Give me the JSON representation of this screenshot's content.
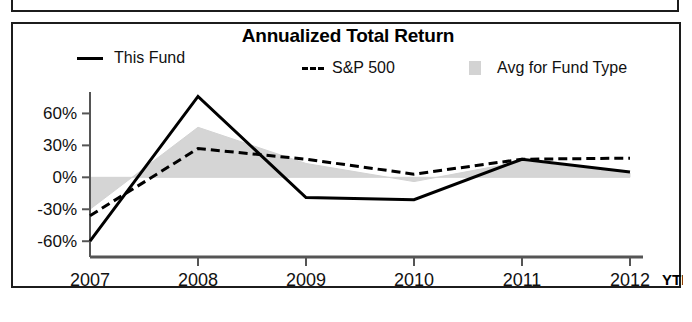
{
  "panel": {
    "title": "Annualized Total Return"
  },
  "legend": {
    "items": [
      {
        "key": "this_fund",
        "label": "This Fund",
        "marker": "solid-line"
      },
      {
        "key": "sp500",
        "label": "S&P 500",
        "marker": "dashed-line"
      },
      {
        "key": "avg_fund_type",
        "label": "Avg for Fund Type",
        "marker": "gray-area-swatch"
      }
    ]
  },
  "axis": {
    "y_ticks": [
      "60%",
      "30%",
      "0%",
      "-30%",
      "-60%"
    ],
    "x_ticks": [
      "2007",
      "2008",
      "2009",
      "2010",
      "2011",
      "2012"
    ],
    "x_suffix": "YTD"
  },
  "colors": {
    "line": "#000000",
    "area": "#d3d3d3",
    "axis": "#555555",
    "border": "#1c1c1c",
    "text": "#111111"
  },
  "chart_data": {
    "type": "line",
    "title": "Annualized Total Return",
    "xlabel": "",
    "ylabel": "",
    "x": [
      "2007",
      "2008",
      "2009",
      "2010",
      "2011",
      "2012"
    ],
    "x_note": "2012 value is YTD",
    "ylim": [
      -72,
      82
    ],
    "yticks": [
      -60,
      -30,
      0,
      30,
      60
    ],
    "ytick_labels": [
      "-60%",
      "-30%",
      "0%",
      "30%",
      "60%"
    ],
    "grid": false,
    "legend_position": "top",
    "series": [
      {
        "name": "This Fund",
        "style": "solid",
        "color": "#000000",
        "values": [
          -60,
          76,
          -19,
          -21,
          17,
          5
        ]
      },
      {
        "name": "S&P 500",
        "style": "dashed",
        "color": "#000000",
        "values": [
          -36,
          27,
          17,
          3,
          17,
          18
        ]
      },
      {
        "name": "Avg for Fund Type",
        "style": "area",
        "color": "#d3d3d3",
        "values": [
          -30,
          47,
          13,
          -4,
          15,
          4
        ]
      }
    ],
    "area_baseline": 0
  }
}
